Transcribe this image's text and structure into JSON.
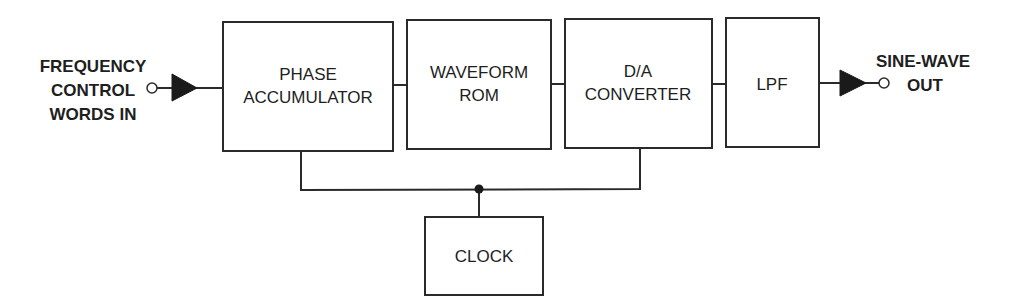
{
  "diagram": {
    "type": "block-diagram",
    "input": {
      "lines": [
        "FREQUENCY",
        "CONTROL",
        "WORDS IN"
      ]
    },
    "output": {
      "lines": [
        "SINE-WAVE",
        "OUT"
      ]
    },
    "blocks": {
      "phase_accumulator": [
        "PHASE",
        "ACCUMULATOR"
      ],
      "waveform_rom": [
        "WAVEFORM",
        "ROM"
      ],
      "da_converter": [
        "D/A",
        "CONVERTER"
      ],
      "lpf": [
        "LPF"
      ],
      "clock": [
        "CLOCK"
      ]
    },
    "signal_chain": [
      "input",
      "phase_accumulator",
      "waveform_rom",
      "da_converter",
      "lpf",
      "output"
    ],
    "clock_feeds": [
      "phase_accumulator",
      "da_converter"
    ],
    "colors": {
      "line": "#2a2a2a",
      "text": "#1e1e1e",
      "background": "#ffffff"
    }
  }
}
